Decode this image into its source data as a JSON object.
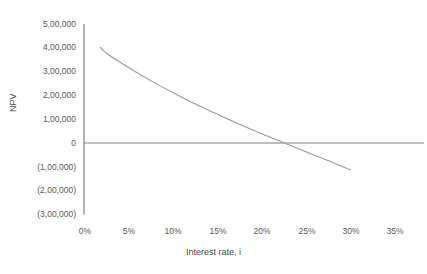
{
  "chart_data": {
    "type": "line",
    "title": "",
    "xlabel": "Interest rate, i",
    "ylabel": "NPV",
    "xlim": [
      0,
      35
    ],
    "ylim": [
      -300000,
      500000
    ],
    "grid": false,
    "legend": "none",
    "x_tick_labels": [
      "0%",
      "5%",
      "10%",
      "15%",
      "20%",
      "25%",
      "30%",
      "35%"
    ],
    "x_tick_values": [
      0,
      5,
      10,
      15,
      20,
      25,
      30,
      35
    ],
    "y_tick_labels": [
      "5,00,000",
      "4,00,000",
      "3,00,000",
      "2,00,000",
      "1,00,000",
      "0",
      "(1,00,000)",
      "(2,00,000)",
      "(3,00,000)"
    ],
    "y_tick_values": [
      500000,
      400000,
      300000,
      200000,
      100000,
      0,
      -100000,
      -200000,
      -300000
    ],
    "zero_line": 0,
    "series": [
      {
        "name": "NPV",
        "color": "#9a9a9a",
        "x": [
          1.7,
          2.5,
          5,
          7.5,
          10,
          12.5,
          15,
          17.5,
          20,
          22.5,
          25,
          27.5,
          30
        ],
        "values": [
          403000,
          375000,
          315000,
          260000,
          210000,
          163000,
          120000,
          78000,
          38000,
          0,
          -38000,
          -75000,
          -113000
        ]
      }
    ],
    "annotations": {
      "irr_crossing_percent": 22.5
    }
  },
  "axes": {
    "axis_color": "#808080",
    "tick_text_color": "#595959"
  }
}
